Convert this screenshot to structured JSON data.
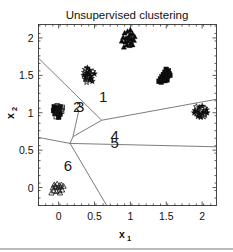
{
  "chart_data": {
    "type": "scatter",
    "title": "Unsupervised clustering",
    "xlabel": "x",
    "xlabel_sub": "1",
    "ylabel": "x",
    "ylabel_sub": "2",
    "xlim": [
      -0.28,
      2.2
    ],
    "ylim": [
      -0.24,
      2.18
    ],
    "xticks": [
      "0",
      "0.5",
      "1",
      "1.5",
      "2"
    ],
    "xtick_values": [
      0,
      0.5,
      1,
      1.5,
      2
    ],
    "yticks": [
      "0",
      "0.5",
      "1",
      "1.5",
      "2"
    ],
    "ytick_values": [
      0,
      0.5,
      1,
      1.5,
      2
    ],
    "grid": false,
    "legend": "none",
    "cluster_labels": [
      {
        "text": "1",
        "x": 0.62,
        "y": 1.14
      },
      {
        "text": "2",
        "x": 0.26,
        "y": 1.01
      },
      {
        "text": "3",
        "x": 0.3,
        "y": 1.01
      },
      {
        "text": "4",
        "x": 0.78,
        "y": 0.62
      },
      {
        "text": "5",
        "x": 0.78,
        "y": 0.53
      },
      {
        "text": "6",
        "x": 0.13,
        "y": 0.22
      }
    ],
    "series": [
      {
        "name": "cluster-top-triangles",
        "marker": "triangle-filled",
        "points": [
          [
            0.92,
            2.07
          ],
          [
            0.96,
            2.09
          ],
          [
            1.0,
            2.11
          ],
          [
            1.03,
            2.06
          ],
          [
            0.9,
            2.01
          ],
          [
            0.94,
            2.0
          ],
          [
            0.98,
            2.02
          ],
          [
            1.02,
            1.99
          ],
          [
            1.06,
            2.02
          ],
          [
            0.88,
            1.96
          ],
          [
            0.93,
            1.95
          ],
          [
            0.97,
            1.96
          ],
          [
            1.01,
            1.94
          ],
          [
            1.05,
            1.97
          ],
          [
            0.95,
            1.91
          ],
          [
            0.99,
            1.9
          ],
          [
            1.03,
            1.91
          ],
          [
            0.91,
            1.88
          ],
          [
            1.0,
            2.05
          ],
          [
            0.97,
            2.0
          ]
        ]
      },
      {
        "name": "cluster-stars-mid-left",
        "marker": "star",
        "points": [
          [
            0.37,
            1.58
          ],
          [
            0.4,
            1.6
          ],
          [
            0.43,
            1.57
          ],
          [
            0.36,
            1.54
          ],
          [
            0.39,
            1.53
          ],
          [
            0.42,
            1.54
          ],
          [
            0.45,
            1.52
          ],
          [
            0.35,
            1.5
          ],
          [
            0.38,
            1.49
          ],
          [
            0.41,
            1.48
          ],
          [
            0.44,
            1.49
          ],
          [
            0.37,
            1.45
          ],
          [
            0.4,
            1.44
          ],
          [
            0.43,
            1.44
          ],
          [
            0.46,
            1.46
          ],
          [
            0.48,
            1.55
          ],
          [
            0.5,
            1.52
          ],
          [
            0.47,
            1.42
          ],
          [
            0.39,
            1.41
          ],
          [
            0.42,
            1.51
          ]
        ]
      },
      {
        "name": "cluster-squares-right",
        "marker": "square-filled",
        "points": [
          [
            1.5,
            1.58
          ],
          [
            1.53,
            1.56
          ],
          [
            1.48,
            1.54
          ],
          [
            1.51,
            1.53
          ],
          [
            1.54,
            1.52
          ],
          [
            1.46,
            1.51
          ],
          [
            1.49,
            1.5
          ],
          [
            1.52,
            1.49
          ],
          [
            1.44,
            1.48
          ],
          [
            1.47,
            1.47
          ],
          [
            1.5,
            1.46
          ],
          [
            1.42,
            1.45
          ],
          [
            1.45,
            1.44
          ],
          [
            1.48,
            1.43
          ],
          [
            1.4,
            1.42
          ],
          [
            1.43,
            1.41
          ],
          [
            1.55,
            1.5
          ],
          [
            1.51,
            1.44
          ]
        ]
      },
      {
        "name": "cluster-stars-far-right",
        "marker": "star",
        "points": [
          [
            1.92,
            1.08
          ],
          [
            1.96,
            1.07
          ],
          [
            2.0,
            1.09
          ],
          [
            2.04,
            1.06
          ],
          [
            1.9,
            1.03
          ],
          [
            1.94,
            1.02
          ],
          [
            1.98,
            1.03
          ],
          [
            2.02,
            1.01
          ],
          [
            2.06,
            1.04
          ],
          [
            1.92,
            0.99
          ],
          [
            1.96,
            0.98
          ],
          [
            2.0,
            0.99
          ],
          [
            2.04,
            0.97
          ],
          [
            1.94,
            0.95
          ],
          [
            1.98,
            0.94
          ],
          [
            2.02,
            0.95
          ],
          [
            2.07,
            1.0
          ],
          [
            1.89,
            1.0
          ]
        ]
      },
      {
        "name": "cluster-squares-left",
        "marker": "square-mixed",
        "points": [
          [
            -0.06,
            1.08
          ],
          [
            -0.02,
            1.09
          ],
          [
            0.02,
            1.08
          ],
          [
            0.05,
            1.07
          ],
          [
            -0.07,
            1.03
          ],
          [
            -0.03,
            1.03
          ],
          [
            0.01,
            1.03
          ],
          [
            0.04,
            1.02
          ],
          [
            -0.05,
            0.99
          ],
          [
            -0.01,
            0.99
          ],
          [
            0.02,
            0.98
          ],
          [
            -0.03,
            0.95
          ],
          [
            0.0,
            0.94
          ],
          [
            0.03,
            1.05
          ],
          [
            -0.04,
            1.06
          ]
        ]
      },
      {
        "name": "cluster-triangles-open-bottom",
        "marker": "triangle-open",
        "points": [
          [
            -0.06,
            0.04
          ],
          [
            -0.02,
            0.05
          ],
          [
            0.01,
            0.03
          ],
          [
            0.04,
            0.04
          ],
          [
            -0.08,
            0.0
          ],
          [
            -0.04,
            0.01
          ],
          [
            0.0,
            0.0
          ],
          [
            0.03,
            0.01
          ],
          [
            0.07,
            0.02
          ],
          [
            -0.07,
            -0.04
          ],
          [
            -0.03,
            -0.05
          ],
          [
            0.01,
            -0.04
          ],
          [
            0.05,
            -0.03
          ],
          [
            -0.1,
            -0.07
          ],
          [
            0.02,
            -0.07
          ],
          [
            -0.05,
            0.02
          ]
        ]
      }
    ],
    "boundaries": [
      {
        "name": "boundary-upper-left",
        "path": [
          [
            -0.28,
            1.73
          ],
          [
            0.6,
            0.9
          ]
        ]
      },
      {
        "name": "boundary-right-upper",
        "path": [
          [
            0.6,
            0.9
          ],
          [
            2.2,
            1.18
          ]
        ]
      },
      {
        "name": "boundary-vertex-down",
        "path": [
          [
            0.6,
            0.9
          ],
          [
            0.2,
            0.68
          ]
        ]
      },
      {
        "name": "boundary-cluster23",
        "path": [
          [
            0.2,
            0.68
          ],
          [
            0.28,
            1.02
          ]
        ]
      },
      {
        "name": "boundary-left-horizontal",
        "path": [
          [
            -0.28,
            0.67
          ],
          [
            0.16,
            0.59
          ]
        ]
      },
      {
        "name": "boundary-triple-join",
        "path": [
          [
            0.16,
            0.59
          ],
          [
            0.2,
            0.68
          ]
        ]
      },
      {
        "name": "boundary-mid-horizontal",
        "path": [
          [
            0.16,
            0.59
          ],
          [
            2.2,
            0.545
          ]
        ]
      },
      {
        "name": "boundary-lower-diagonal",
        "path": [
          [
            0.16,
            0.59
          ],
          [
            0.67,
            -0.24
          ]
        ]
      }
    ]
  }
}
